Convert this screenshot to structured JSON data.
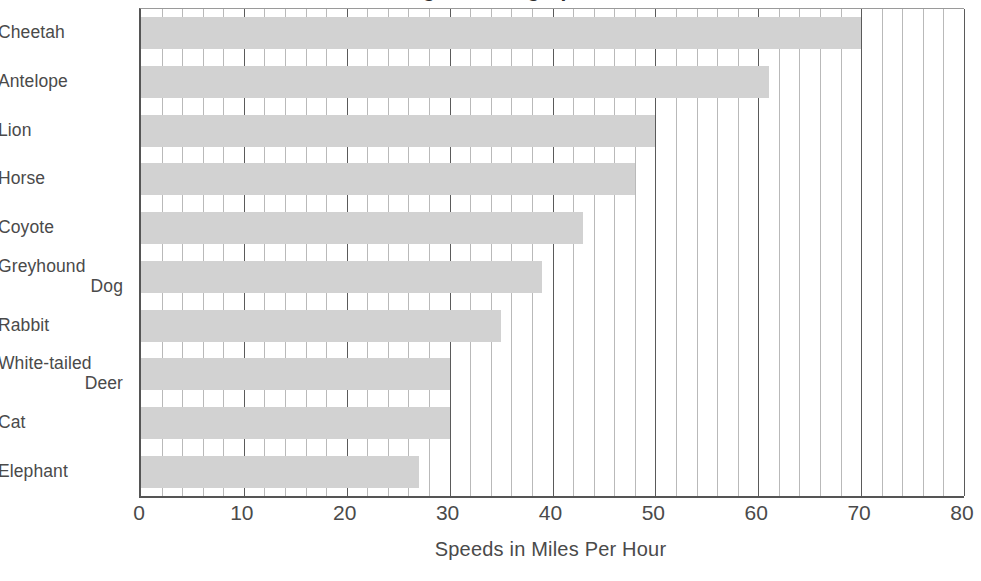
{
  "chart_data": {
    "type": "bar",
    "orientation": "horizontal",
    "title": "Average Running Speeds of Animals",
    "xlabel": "Speeds in Miles Per Hour",
    "ylabel": "",
    "xlim": [
      0,
      80
    ],
    "xticks": [
      0,
      10,
      20,
      30,
      40,
      50,
      60,
      70,
      80
    ],
    "xtick_labels": [
      "0",
      "10",
      "20",
      "30",
      "40",
      "50",
      "60",
      "70",
      "80"
    ],
    "minor_tick_step": 2,
    "grid": "vertical",
    "legend": "none",
    "bar_color": "#d2d2d2",
    "categories": [
      "Cheetah",
      "Antelope",
      "Lion",
      "Horse",
      "Coyote",
      "Greyhound Dog",
      "Rabbit",
      "White-tailed Deer",
      "Cat",
      "Elephant"
    ],
    "category_lines": [
      [
        "Cheetah"
      ],
      [
        "Antelope"
      ],
      [
        "Lion"
      ],
      [
        "Horse"
      ],
      [
        "Coyote"
      ],
      [
        "Greyhound",
        "Dog"
      ],
      [
        "Rabbit"
      ],
      [
        "White-tailed",
        "Deer"
      ],
      [
        "Cat"
      ],
      [
        "Elephant"
      ]
    ],
    "values": [
      70,
      61,
      50,
      48,
      43,
      39,
      35,
      30,
      30,
      27
    ],
    "units": "miles per hour"
  }
}
